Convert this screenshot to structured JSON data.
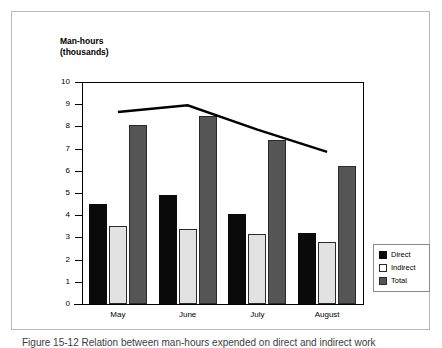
{
  "figure": {
    "caption": "Figure 15-12  Relation between man-hours expended on direct and indirect work"
  },
  "chart_data": {
    "type": "bar",
    "title": "Man-hours\n(thousands)",
    "xlabel": "",
    "ylabel": "Man-hours (thousands)",
    "ylim": [
      0,
      10
    ],
    "ytick_labels": [
      "10",
      "9",
      "8",
      "7",
      "6",
      "5",
      "4",
      "3",
      "2",
      "1",
      "0"
    ],
    "ytick_values": [
      10,
      9,
      8,
      7,
      6,
      5,
      4,
      3,
      2,
      1,
      0
    ],
    "grid": false,
    "legend_position": "right",
    "categories": [
      "May",
      "June",
      "July",
      "August"
    ],
    "series": [
      {
        "name": "Direct",
        "color": "#0a0a0a",
        "values": [
          4.5,
          4.9,
          4.05,
          3.2
        ]
      },
      {
        "name": "Indirect",
        "color": "#e2e2e2",
        "values": [
          3.5,
          3.4,
          3.15,
          2.8
        ]
      },
      {
        "name": "Total",
        "color": "#555555",
        "values": [
          8.05,
          8.45,
          7.4,
          6.2
        ]
      }
    ],
    "overlay_line": {
      "name": "Trend",
      "color": "#000000",
      "x": [
        "May",
        "June",
        "July",
        "August"
      ],
      "values": [
        8.65,
        8.95,
        7.85,
        6.85
      ]
    }
  },
  "legend": {
    "items": [
      {
        "label": "Direct"
      },
      {
        "label": "Indirect"
      },
      {
        "label": "Total"
      }
    ]
  }
}
